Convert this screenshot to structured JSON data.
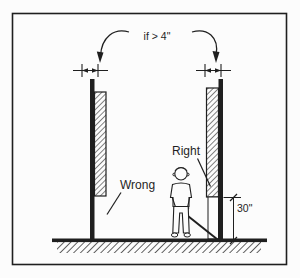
{
  "figure": {
    "annotation_top": "if > 4\"",
    "label_wrong": "Wrong",
    "label_right": "Right",
    "dimension_height": "30\"",
    "colors": {
      "ink": "#1f1f1f",
      "paper": "#fcfcfc"
    }
  }
}
